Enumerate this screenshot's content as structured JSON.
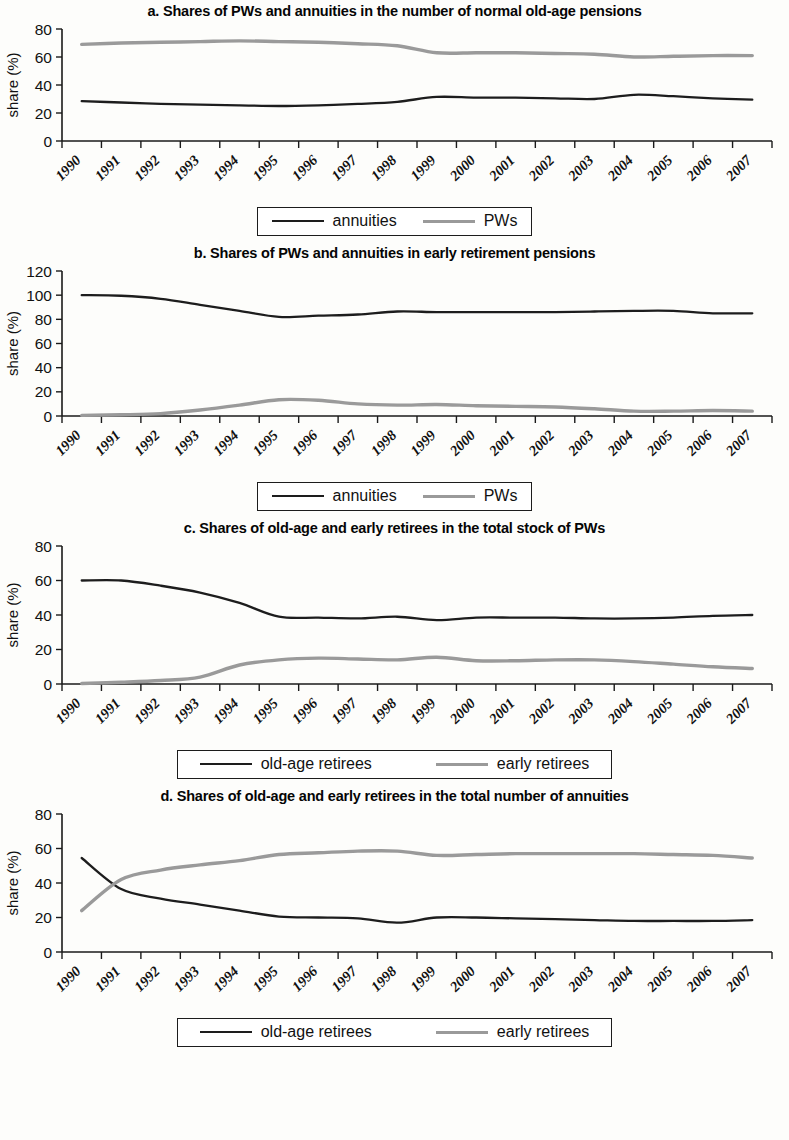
{
  "figure": {
    "y_axis_label": "share (%)",
    "series_colors": {
      "dark": "#1d1d1d",
      "gray": "#9a9a9a"
    }
  },
  "chart_data": [
    {
      "type": "line",
      "panel": "a",
      "title": "a. Shares of PWs and annuities in the number of normal old-age pensions",
      "xlabel": "",
      "ylabel": "share (%)",
      "ylim": [
        0,
        80
      ],
      "yticks": [
        0,
        20,
        40,
        60,
        80
      ],
      "grid": false,
      "legend_position": "bottom",
      "categories": [
        "1990",
        "1991",
        "1992",
        "1993",
        "1994",
        "1995",
        "1996",
        "1997",
        "1998",
        "1999",
        "2000",
        "2001",
        "2002",
        "2003",
        "2004",
        "2005",
        "2006",
        "2007"
      ],
      "series": [
        {
          "name": "annuities",
          "color": "#1d1d1d",
          "values": [
            28.5,
            27.5,
            26.5,
            26.0,
            25.5,
            25.0,
            25.5,
            26.5,
            28.0,
            31.5,
            31.0,
            31.0,
            30.5,
            30.0,
            33.0,
            32.0,
            30.5,
            29.5
          ]
        },
        {
          "name": "PWs",
          "color": "#9a9a9a",
          "values": [
            69.0,
            70.0,
            70.5,
            71.0,
            71.5,
            71.0,
            70.5,
            69.5,
            68.0,
            63.0,
            63.0,
            63.0,
            62.5,
            62.0,
            60.0,
            60.5,
            61.0,
            61.0
          ]
        }
      ]
    },
    {
      "type": "line",
      "panel": "b",
      "title": "b. Shares of PWs and annuities in early retirement pensions",
      "xlabel": "",
      "ylabel": "share (%)",
      "ylim": [
        0,
        120
      ],
      "yticks": [
        0,
        20,
        40,
        60,
        80,
        100,
        120
      ],
      "grid": false,
      "legend_position": "bottom",
      "categories": [
        "1990",
        "1991",
        "1992",
        "1993",
        "1994",
        "1995",
        "1996",
        "1997",
        "1998",
        "1999",
        "2000",
        "2001",
        "2002",
        "2003",
        "2004",
        "2005",
        "2006",
        "2007"
      ],
      "series": [
        {
          "name": "annuities",
          "color": "#1d1d1d",
          "values": [
            100.0,
            99.5,
            97.0,
            92.0,
            87.0,
            82.0,
            83.0,
            84.0,
            86.5,
            86.0,
            86.0,
            86.0,
            86.0,
            86.5,
            87.0,
            87.0,
            85.0,
            85.0
          ]
        },
        {
          "name": "PWs",
          "color": "#9a9a9a",
          "values": [
            0.5,
            1.0,
            2.0,
            5.0,
            9.0,
            13.5,
            13.0,
            10.0,
            9.0,
            9.5,
            8.5,
            8.0,
            7.5,
            6.0,
            4.0,
            4.0,
            4.5,
            4.0
          ]
        }
      ]
    },
    {
      "type": "line",
      "panel": "c",
      "title": "c. Shares of old-age and early retirees in the total stock of PWs",
      "xlabel": "",
      "ylabel": "share (%)",
      "ylim": [
        0,
        80
      ],
      "yticks": [
        0,
        20,
        40,
        60,
        80
      ],
      "grid": false,
      "legend_position": "bottom",
      "categories": [
        "1990",
        "1991",
        "1992",
        "1993",
        "1994",
        "1995",
        "1996",
        "1997",
        "1998",
        "1999",
        "2000",
        "2001",
        "2002",
        "2003",
        "2004",
        "2005",
        "2006",
        "2007"
      ],
      "series": [
        {
          "name": "old-age retirees",
          "color": "#1d1d1d",
          "values": [
            60.0,
            60.0,
            57.0,
            53.0,
            47.0,
            39.0,
            38.5,
            38.0,
            39.0,
            37.0,
            38.5,
            38.5,
            38.5,
            38.0,
            38.0,
            38.5,
            39.5,
            40.0
          ]
        },
        {
          "name": "early retirees",
          "color": "#9a9a9a",
          "values": [
            0.3,
            1.0,
            2.0,
            4.0,
            11.0,
            14.0,
            15.0,
            14.5,
            14.0,
            15.5,
            13.5,
            13.5,
            14.0,
            14.0,
            13.0,
            11.5,
            10.0,
            9.0
          ]
        }
      ]
    },
    {
      "type": "line",
      "panel": "d",
      "title": "d. Shares of old-age and early retirees in the total number of annuities",
      "xlabel": "",
      "ylabel": "share (%)",
      "ylim": [
        0,
        80
      ],
      "yticks": [
        0,
        20,
        40,
        60,
        80
      ],
      "grid": false,
      "legend_position": "bottom",
      "categories": [
        "1990",
        "1991",
        "1992",
        "1993",
        "1994",
        "1995",
        "1996",
        "1997",
        "1998",
        "1999",
        "2000",
        "2001",
        "2002",
        "2003",
        "2004",
        "2005",
        "2006",
        "2007"
      ],
      "series": [
        {
          "name": "old-age retirees",
          "color": "#1d1d1d",
          "values": [
            54.5,
            36.5,
            31.0,
            27.5,
            24.0,
            20.5,
            20.0,
            19.5,
            17.0,
            20.0,
            20.0,
            19.5,
            19.0,
            18.5,
            18.0,
            18.0,
            18.0,
            18.5
          ]
        },
        {
          "name": "early retirees",
          "color": "#9a9a9a",
          "values": [
            24.0,
            42.0,
            47.5,
            50.5,
            53.0,
            56.5,
            57.5,
            58.5,
            58.5,
            56.0,
            56.5,
            57.0,
            57.0,
            57.0,
            57.0,
            56.5,
            56.0,
            54.5
          ]
        }
      ]
    }
  ]
}
